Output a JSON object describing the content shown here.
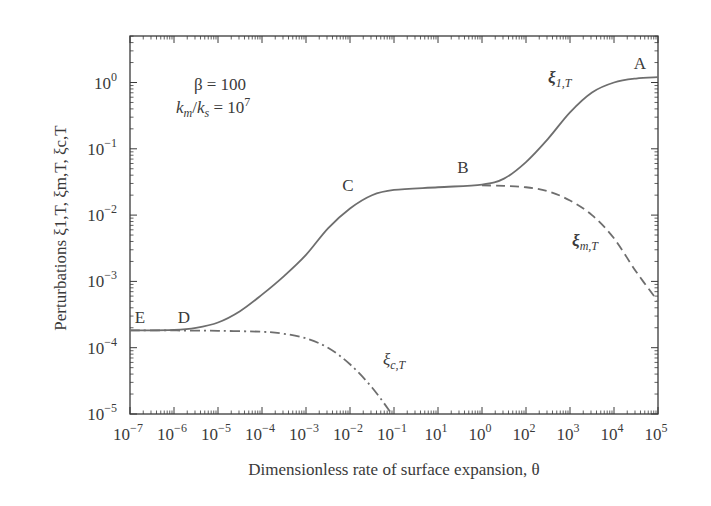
{
  "chart_data": {
    "type": "line",
    "title": "",
    "xlabel": "Dimensionless rate of surface expansion, θ",
    "ylabel": "Perturbations ξ1,T, ξm,T, ξc,T",
    "xscale": "log",
    "yscale": "log",
    "xlim": [
      1e-07,
      100000.0
    ],
    "ylim": [
      1e-05,
      5
    ],
    "grid": false,
    "x_tick_labels": [
      {
        "base": "10",
        "exp": "−7"
      },
      {
        "base": "10",
        "exp": "−6"
      },
      {
        "base": "10",
        "exp": "−5"
      },
      {
        "base": "10",
        "exp": "−4"
      },
      {
        "base": "10",
        "exp": "−3"
      },
      {
        "base": "10",
        "exp": "−2"
      },
      {
        "base": "10",
        "exp": "−1"
      },
      {
        "base": "10",
        "exp": "1"
      },
      {
        "base": "10",
        "exp": "0"
      },
      {
        "base": "10",
        "exp": "2"
      },
      {
        "base": "10",
        "exp": "3"
      },
      {
        "base": "10",
        "exp": "4"
      },
      {
        "base": "10",
        "exp": "5"
      }
    ],
    "y_tick_labels": [
      {
        "base": "10",
        "exp": "0"
      },
      {
        "base": "10",
        "exp": "−1"
      },
      {
        "base": "10",
        "exp": "−2"
      },
      {
        "base": "10",
        "exp": "−3"
      },
      {
        "base": "10",
        "exp": "−4"
      },
      {
        "base": "10",
        "exp": "−5"
      }
    ],
    "parameters": {
      "line1": "β = 100",
      "line2_lhs_a": "k",
      "line2_sub_a": "m",
      "line2_slash": "/",
      "line2_lhs_b": "k",
      "line2_sub_b": "s",
      "line2_rhs": " = 10",
      "line2_exp": "7"
    },
    "point_labels": [
      "A",
      "B",
      "C",
      "D",
      "E"
    ],
    "series": [
      {
        "name": "ξ1,T",
        "label_main": "ξ",
        "label_sub": "1,T",
        "style": "solid",
        "x_log10": [
          -7,
          -6,
          -5.5,
          -5,
          -4.5,
          -4,
          -3.5,
          -3,
          -2.5,
          -2,
          -1.5,
          -1,
          0,
          1,
          1.5,
          2,
          2.5,
          3,
          3.5,
          4,
          4.5,
          5
        ],
        "y_log10": [
          -3.74,
          -3.73,
          -3.7,
          -3.62,
          -3.45,
          -3.2,
          -2.92,
          -2.6,
          -2.2,
          -1.9,
          -1.7,
          -1.62,
          -1.58,
          -1.54,
          -1.45,
          -1.2,
          -0.85,
          -0.45,
          -0.15,
          0.0,
          0.06,
          0.08
        ]
      },
      {
        "name": "ξm,T",
        "label_main": "ξ",
        "label_sub": "m,T",
        "style": "dashed",
        "x_log10": [
          1,
          1.5,
          2,
          2.5,
          3,
          3.5,
          4,
          4.5,
          5
        ],
        "y_log10": [
          -1.55,
          -1.56,
          -1.58,
          -1.64,
          -1.78,
          -2.0,
          -2.35,
          -2.85,
          -3.3
        ]
      },
      {
        "name": "ξc,T",
        "label_main": "ξ",
        "label_sub": "c,T",
        "style": "dashdot",
        "x_log10": [
          -7,
          -6,
          -5,
          -4,
          -3.5,
          -3,
          -2.5,
          -2,
          -1.5,
          -1.05
        ],
        "y_log10": [
          -3.74,
          -3.74,
          -3.745,
          -3.76,
          -3.79,
          -3.86,
          -4.0,
          -4.25,
          -4.6,
          -5.0
        ]
      }
    ]
  },
  "colors": {
    "ink": "#3a3a3a",
    "curve": "#6e6e6e",
    "background": "#ffffff"
  }
}
